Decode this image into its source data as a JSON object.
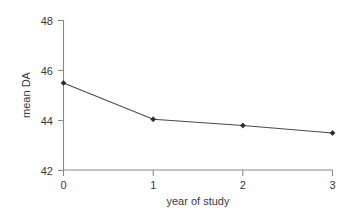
{
  "chart_data": {
    "type": "line",
    "title": "",
    "xlabel": "year of study",
    "ylabel": "mean DA",
    "x": [
      0,
      1,
      2,
      3
    ],
    "values": [
      45.5,
      44.05,
      43.8,
      43.5
    ],
    "xticks": [
      "0",
      "1",
      "2",
      "3"
    ],
    "yticks": [
      "42",
      "44",
      "46",
      "48"
    ],
    "xlim": [
      0,
      3
    ],
    "ylim": [
      42,
      48
    ],
    "grid": false,
    "legend": false,
    "series": [
      {
        "name": "mean DA",
        "values": [
          45.5,
          44.05,
          43.8,
          43.5
        ]
      }
    ],
    "colors": {
      "line": "#4a4a4a",
      "marker": "#2b2b2b",
      "axis": "#8a8a8a",
      "text": "#3a3a3a",
      "background": "#ffffff"
    }
  }
}
